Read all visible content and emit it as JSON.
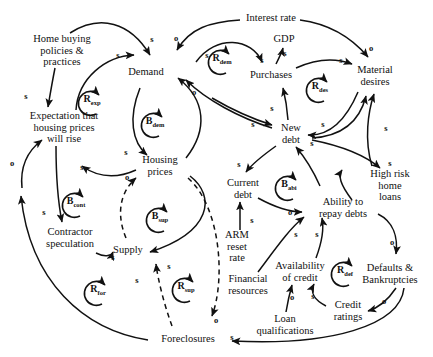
{
  "diagram": {
    "type": "causal-loop-diagram",
    "width": 433,
    "height": 357,
    "background_color": "#ffffff",
    "stroke_color": "#111111"
  },
  "nodes": [
    {
      "id": "home-buying-policies",
      "label": "Home buying\npolicies &\npractices",
      "x": 62,
      "y": 50
    },
    {
      "id": "expectation-housing-prices",
      "label": "Expectation that\nhousing prices\nwill rise",
      "x": 64,
      "y": 127
    },
    {
      "id": "demand",
      "label": "Demand",
      "x": 146,
      "y": 72
    },
    {
      "id": "housing-prices",
      "label": "Housing\nprices",
      "x": 160,
      "y": 165
    },
    {
      "id": "contractor-speculation",
      "label": "Contractor\nspeculation",
      "x": 70,
      "y": 237
    },
    {
      "id": "supply",
      "label": "Supply",
      "x": 128,
      "y": 250
    },
    {
      "id": "foreclosures",
      "label": "Foreclosures",
      "x": 188,
      "y": 339
    },
    {
      "id": "interest-rate",
      "label": "Interest rate",
      "x": 271,
      "y": 18
    },
    {
      "id": "gdp",
      "label": "GDP",
      "x": 284,
      "y": 39
    },
    {
      "id": "purchases",
      "label": "Purchases",
      "x": 271,
      "y": 75
    },
    {
      "id": "new-debt",
      "label": "New\ndebt",
      "x": 291,
      "y": 133
    },
    {
      "id": "material-desires",
      "label": "Material\ndesires",
      "x": 375,
      "y": 75
    },
    {
      "id": "high-risk-home-loans",
      "label": "High risk\nhome\nloans",
      "x": 390,
      "y": 185
    },
    {
      "id": "current-debt",
      "label": "Current\ndebt",
      "x": 243,
      "y": 188
    },
    {
      "id": "ability-to-repay-debts",
      "label": "Ability to\nrepay debts",
      "x": 343,
      "y": 207
    },
    {
      "id": "arm-reset-rate",
      "label": "ARM\nreset\nrate",
      "x": 237,
      "y": 246
    },
    {
      "id": "financial-resources",
      "label": "Financial\nresources",
      "x": 248,
      "y": 284
    },
    {
      "id": "availability-of-credit",
      "label": "Availability\nof credit",
      "x": 300,
      "y": 271
    },
    {
      "id": "defaults-bankruptcies",
      "label": "Defaults &\nBankruptcies",
      "x": 390,
      "y": 273
    },
    {
      "id": "credit-ratings",
      "label": "Credit\nratings",
      "x": 348,
      "y": 310
    },
    {
      "id": "loan-qualifications",
      "label": "Loan\nqualifications",
      "x": 285,
      "y": 324
    }
  ],
  "loops": [
    {
      "id": "r-exp",
      "letter": "R",
      "subscript": "exp",
      "x": 92,
      "y": 101,
      "direction": "clockwise"
    },
    {
      "id": "b-dem",
      "letter": "B",
      "subscript": "dem",
      "x": 155,
      "y": 123,
      "direction": "clockwise"
    },
    {
      "id": "r-dem",
      "letter": "R",
      "subscript": "dem",
      "x": 222,
      "y": 60,
      "direction": "clockwise"
    },
    {
      "id": "r-des",
      "letter": "R",
      "subscript": "des",
      "x": 320,
      "y": 88,
      "direction": "clockwise"
    },
    {
      "id": "b-cont",
      "letter": "B",
      "subscript": "cont",
      "x": 76,
      "y": 203,
      "direction": "clockwise"
    },
    {
      "id": "b-sup",
      "letter": "B",
      "subscript": "sup",
      "x": 160,
      "y": 218,
      "direction": "clockwise"
    },
    {
      "id": "r-for",
      "letter": "R",
      "subscript": "for",
      "x": 98,
      "y": 291,
      "direction": "clockwise"
    },
    {
      "id": "r-sup",
      "letter": "R",
      "subscript": "sup",
      "x": 186,
      "y": 288,
      "direction": "clockwise"
    },
    {
      "id": "b-abi",
      "letter": "B",
      "subscript": "abi",
      "x": 289,
      "y": 186,
      "direction": "clockwise"
    },
    {
      "id": "r-def",
      "letter": "R",
      "subscript": "def",
      "x": 345,
      "y": 272,
      "direction": "clockwise"
    }
  ],
  "polarities": [
    {
      "id": "p01",
      "mark": "s",
      "x": 152,
      "y": 39
    },
    {
      "id": "p02",
      "mark": "o",
      "x": 176,
      "y": 38
    },
    {
      "id": "p03",
      "mark": "s",
      "x": 118,
      "y": 55
    },
    {
      "id": "p04",
      "mark": "s",
      "x": 207,
      "y": 55
    },
    {
      "id": "p05",
      "mark": "o",
      "x": 194,
      "y": 92
    },
    {
      "id": "p06",
      "mark": "s",
      "x": 26,
      "y": 96
    },
    {
      "id": "p07",
      "mark": "s",
      "x": 126,
      "y": 152
    },
    {
      "id": "p08",
      "mark": "s",
      "x": 82,
      "y": 167
    },
    {
      "id": "p09",
      "mark": "o",
      "x": 12,
      "y": 163
    },
    {
      "id": "p10",
      "mark": "o",
      "x": 127,
      "y": 177
    },
    {
      "id": "p11",
      "mark": "s",
      "x": 44,
      "y": 212
    },
    {
      "id": "p12",
      "mark": "s",
      "x": 113,
      "y": 257
    },
    {
      "id": "p13",
      "mark": "s",
      "x": 169,
      "y": 266
    },
    {
      "id": "p14",
      "mark": "s",
      "x": 137,
      "y": 280
    },
    {
      "id": "p15",
      "mark": "o",
      "x": 216,
      "y": 320
    },
    {
      "id": "p16",
      "mark": "s",
      "x": 262,
      "y": 60
    },
    {
      "id": "p17",
      "mark": "s",
      "x": 285,
      "y": 53
    },
    {
      "id": "p18",
      "mark": "s",
      "x": 341,
      "y": 60
    },
    {
      "id": "p19",
      "mark": "o",
      "x": 371,
      "y": 48
    },
    {
      "id": "p20",
      "mark": "s",
      "x": 272,
      "y": 108
    },
    {
      "id": "p21",
      "mark": "s",
      "x": 253,
      "y": 124
    },
    {
      "id": "p22",
      "mark": "s",
      "x": 323,
      "y": 124
    },
    {
      "id": "p23",
      "mark": "s",
      "x": 312,
      "y": 143
    },
    {
      "id": "p24",
      "mark": "s",
      "x": 386,
      "y": 128
    },
    {
      "id": "p25",
      "mark": "s",
      "x": 390,
      "y": 163
    },
    {
      "id": "p26",
      "mark": "s",
      "x": 239,
      "y": 164
    },
    {
      "id": "p27",
      "mark": "s",
      "x": 252,
      "y": 220
    },
    {
      "id": "p28",
      "mark": "o",
      "x": 290,
      "y": 212
    },
    {
      "id": "p29",
      "mark": "s",
      "x": 296,
      "y": 234
    },
    {
      "id": "p30",
      "mark": "s",
      "x": 317,
      "y": 234
    },
    {
      "id": "p31",
      "mark": "o",
      "x": 392,
      "y": 242
    },
    {
      "id": "p32",
      "mark": "o",
      "x": 292,
      "y": 297
    },
    {
      "id": "p33",
      "mark": "s",
      "x": 313,
      "y": 296
    },
    {
      "id": "p34",
      "mark": "o",
      "x": 384,
      "y": 301
    },
    {
      "id": "p35",
      "mark": "s",
      "x": 232,
      "y": 337
    }
  ]
}
